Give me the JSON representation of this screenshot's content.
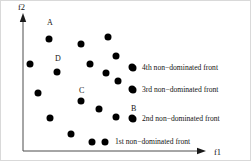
{
  "figure": {
    "background_color": "#ffffff",
    "border_color": "#d9d9d9",
    "point_color": "#000000",
    "axis_color": "#4d4d4d",
    "text_color": "#141414"
  },
  "axes": {
    "y_label": "f2",
    "x_label": "f1",
    "origin": {
      "x": 22,
      "y": 150
    },
    "y_top": 12,
    "x_right": 205
  },
  "chart_data": {
    "type": "scatter",
    "title": "",
    "xlabel": "f1",
    "ylabel": "f2",
    "xlim": [
      0,
      205
    ],
    "ylim": [
      0,
      150
    ],
    "grid": false,
    "legend_position": "right",
    "point_radius": 3.5,
    "points": [
      {
        "id": "p1",
        "x": 48,
        "y": 38,
        "label": "A",
        "label_x": 46,
        "label_y": 18
      },
      {
        "id": "p2",
        "x": 29,
        "y": 63,
        "label": "",
        "label_x": 0,
        "label_y": 0
      },
      {
        "id": "p3",
        "x": 56,
        "y": 71,
        "label": "D",
        "label_x": 54,
        "label_y": 54
      },
      {
        "id": "p4",
        "x": 37,
        "y": 92,
        "label": "",
        "label_x": 0,
        "label_y": 0
      },
      {
        "id": "p5",
        "x": 80,
        "y": 43,
        "label": "",
        "label_x": 0,
        "label_y": 0
      },
      {
        "id": "p6",
        "x": 107,
        "y": 36,
        "label": "",
        "label_x": 0,
        "label_y": 0
      },
      {
        "id": "p7",
        "x": 89,
        "y": 63,
        "label": "",
        "label_x": 0,
        "label_y": 0
      },
      {
        "id": "p8",
        "x": 115,
        "y": 55,
        "label": "",
        "label_x": 0,
        "label_y": 0
      },
      {
        "id": "p9",
        "x": 105,
        "y": 72,
        "label": "",
        "label_x": 0,
        "label_y": 0
      },
      {
        "id": "p10",
        "x": 117,
        "y": 80,
        "label": "",
        "label_x": 0,
        "label_y": 0
      },
      {
        "id": "p11",
        "x": 132,
        "y": 67,
        "label": "",
        "label_x": 0,
        "label_y": 0
      },
      {
        "id": "p12",
        "x": 132,
        "y": 89,
        "label": "",
        "label_x": 0,
        "label_y": 0
      },
      {
        "id": "p13",
        "x": 49,
        "y": 117,
        "label": "",
        "label_x": 0,
        "label_y": 0
      },
      {
        "id": "p14",
        "x": 80,
        "y": 100,
        "label": "C",
        "label_x": 78,
        "label_y": 86
      },
      {
        "id": "p15",
        "x": 98,
        "y": 108,
        "label": "",
        "label_x": 0,
        "label_y": 0
      },
      {
        "id": "p16",
        "x": 115,
        "y": 116,
        "label": "",
        "label_x": 0,
        "label_y": 0
      },
      {
        "id": "p17",
        "x": 132,
        "y": 118,
        "label": "B",
        "label_x": 130,
        "label_y": 104
      },
      {
        "id": "p18",
        "x": 70,
        "y": 133,
        "label": "",
        "label_x": 0,
        "label_y": 0
      },
      {
        "id": "p19",
        "x": 91,
        "y": 141,
        "label": "",
        "label_x": 0,
        "label_y": 0
      },
      {
        "id": "p20",
        "x": 104,
        "y": 141,
        "label": "",
        "label_x": 0,
        "label_y": 0
      }
    ],
    "legend": [
      {
        "id": "front4",
        "label": "4th non−dominated front",
        "marker_x": 131,
        "marker_y": 66,
        "text_x": 141,
        "text_y": 63,
        "has_marker": true
      },
      {
        "id": "front3",
        "label": "3rd non−dominated front",
        "marker_x": 131,
        "marker_y": 88,
        "text_x": 141,
        "text_y": 85,
        "has_marker": true
      },
      {
        "id": "front2",
        "label": "2nd  non−dominated front",
        "marker_x": 131,
        "marker_y": 117,
        "text_x": 141,
        "text_y": 114,
        "has_marker": true
      },
      {
        "id": "front1",
        "label": "1st non−dominated front",
        "marker_x": 0,
        "marker_y": 0,
        "text_x": 114,
        "text_y": 137,
        "has_marker": false
      }
    ]
  }
}
